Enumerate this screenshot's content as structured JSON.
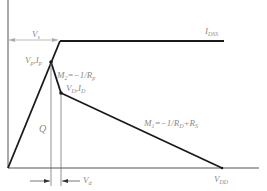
{
  "diagram": {
    "title": "",
    "colors": {
      "line": "#1a1a1a",
      "axis": "#555555",
      "guide": "#9a9a9a",
      "label": "#8a8a8a"
    },
    "labels": {
      "vs": {
        "main": "V",
        "sub": "s"
      },
      "idss": {
        "main": "I",
        "sub": "DSS"
      },
      "vp_ip": {
        "text": "V",
        "sub1": "p",
        "mid": ",I",
        "sub2": "p"
      },
      "m2": {
        "text": "M",
        "sub": "2",
        "rest": "=−1/R",
        "sub2": "p"
      },
      "vd_id": {
        "text": "V",
        "sub1": "D",
        "mid": ",I",
        "sub2": "D"
      },
      "q": "Q",
      "m1": {
        "text": "M",
        "sub": "1",
        "rest": "=−1/R",
        "sub2": "D",
        "rest2": "+R",
        "sub3": "S"
      },
      "vdd": {
        "main": "V",
        "sub": "DD"
      },
      "vd_width": {
        "main": "V",
        "sub": "d"
      }
    },
    "points": {
      "origin": [
        8,
        168
      ],
      "knee": [
        60,
        41
      ],
      "peak_vp_ip": [
        51,
        62
      ],
      "operating_vd_id": [
        61,
        93
      ],
      "vdd": [
        222,
        168
      ],
      "idss_end": [
        224,
        41
      ],
      "x_axis_end": [
        259,
        168
      ]
    }
  }
}
